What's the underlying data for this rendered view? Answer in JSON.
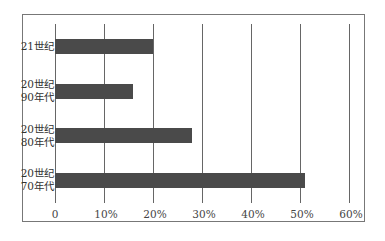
{
  "chart_data": {
    "type": "bar",
    "orientation": "horizontal",
    "title": "",
    "xlabel": "",
    "ylabel": "",
    "categories": [
      "21世纪",
      "20世纪\n90年代",
      "20世纪\n80年代",
      "20世纪\n70年代"
    ],
    "values": [
      20,
      16,
      28,
      51
    ],
    "unit": "%",
    "xlim": [
      0,
      60
    ],
    "xticks": [
      "0",
      "10%",
      "20%",
      "30%",
      "40%",
      "50%",
      "60%"
    ],
    "grid": true,
    "legend": null,
    "bar_color": "#4a4a4a"
  },
  "labels": {
    "cat0": "21世纪",
    "cat1": "20世纪\n90年代",
    "cat2": "20世纪\n80年代",
    "cat3": "20世纪\n70年代"
  },
  "ticks": {
    "t0": "0",
    "t1": "10%",
    "t2": "20%",
    "t3": "30%",
    "t4": "40%",
    "t5": "50%",
    "t6": "60%"
  }
}
